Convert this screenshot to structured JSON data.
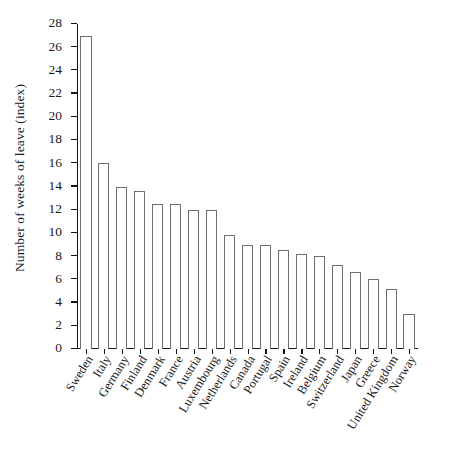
{
  "chart_data": {
    "type": "bar",
    "title": "",
    "subtitle": "",
    "xlabel": "",
    "ylabel": "Number of weeks of leave (index)",
    "categories": [
      "Sweden",
      "Italy",
      "Germany",
      "Finland",
      "Denmark",
      "France",
      "Austria",
      "Luxembourg",
      "Netherlands",
      "Canada",
      "Portugal",
      "Spain",
      "Ireland",
      "Belgium",
      "Switzerland",
      "Japan",
      "Greece",
      "United Kingdom",
      "Norway"
    ],
    "values": [
      27,
      16,
      14,
      13.6,
      12.5,
      12.5,
      12,
      12,
      9.8,
      9,
      9,
      8.5,
      8.2,
      8,
      7.2,
      6.6,
      6,
      5.2,
      3
    ],
    "ylim": [
      0,
      28
    ],
    "ytick_values": [
      0,
      2,
      4,
      6,
      8,
      10,
      12,
      14,
      16,
      18,
      20,
      22,
      24,
      26,
      28
    ],
    "ytick_labels": [
      "0",
      "2",
      "4",
      "6",
      "8",
      "10",
      "12",
      "14",
      "16",
      "18",
      "20",
      "22",
      "24",
      "26",
      "28"
    ],
    "grid": false,
    "legend": null,
    "legend_position": "none",
    "bar_fill_color": "#ffffff",
    "bar_edge_color": "#6e6e6e",
    "axis_color": "#141414",
    "background_color": "#ffffff"
  }
}
